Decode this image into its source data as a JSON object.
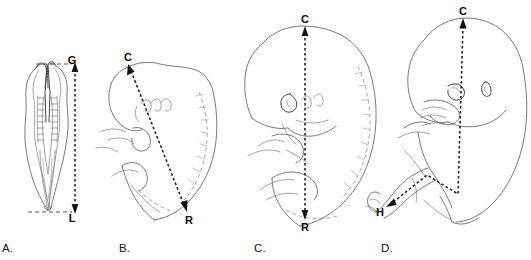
{
  "figure": {
    "background_color": "#ffffff",
    "ink_color": "#6a6a6a",
    "measure_color": "#161616"
  },
  "panels": [
    {
      "id": "A",
      "letter": "A.",
      "subject": "early-embryo-dorsal-view-neural-folds-somites",
      "measurement": "greatest-length",
      "labels": [
        {
          "text": "G",
          "meaning": "greatest-length-upper-point",
          "x": 72,
          "y": 64
        },
        {
          "text": "L",
          "meaning": "greatest-length-lower-point",
          "x": 72,
          "y": 214
        }
      ]
    },
    {
      "id": "B",
      "letter": "B.",
      "subject": "curved-embryo-lateral-view-pharyngeal-arches-limb-buds",
      "measurement": "crown-rump-length",
      "labels": [
        {
          "text": "C",
          "meaning": "crown",
          "x": 128,
          "y": 64
        },
        {
          "text": "R",
          "meaning": "rump",
          "x": 187,
          "y": 219
        }
      ]
    },
    {
      "id": "C",
      "letter": "C.",
      "subject": "late-embryo-lateral-view-ear-limb-buds",
      "measurement": "crown-rump-length",
      "labels": [
        {
          "text": "C",
          "meaning": "crown",
          "x": 304,
          "y": 24
        },
        {
          "text": "R",
          "meaning": "rump",
          "x": 307,
          "y": 226
        }
      ]
    },
    {
      "id": "D",
      "letter": "D.",
      "subject": "fetus-lateral-view-hand-near-face-flexed-leg",
      "measurement": "crown-heel-length",
      "labels": [
        {
          "text": "C",
          "meaning": "crown",
          "x": 462,
          "y": 14
        },
        {
          "text": "H",
          "meaning": "heel",
          "x": 379,
          "y": 213
        }
      ]
    }
  ],
  "panel_letters": [
    {
      "text": "A.",
      "x": 2,
      "y": 252
    },
    {
      "text": "B.",
      "x": 119,
      "y": 252
    },
    {
      "text": "C.",
      "x": 254,
      "y": 252
    },
    {
      "text": "D.",
      "x": 381,
      "y": 252
    }
  ]
}
